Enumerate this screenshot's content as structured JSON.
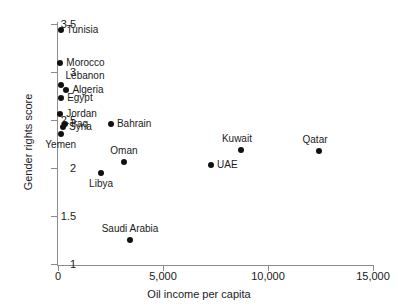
{
  "chart_data": {
    "type": "scatter",
    "title": "",
    "xlabel": "Oil income per capita",
    "ylabel": "Gender rights score",
    "xlim": [
      0,
      15000
    ],
    "ylim": [
      1,
      3.5
    ],
    "grid": false,
    "legend": "none",
    "xticks": [
      "0",
      "5,000",
      "10,000",
      "15,000"
    ],
    "xtick_values": [
      0,
      5000,
      10000,
      15000
    ],
    "yticks": [
      "1",
      "1.5",
      "2",
      "2.5",
      "3",
      "3.5"
    ],
    "ytick_values": [
      1,
      1.5,
      2,
      2.5,
      3,
      3.5
    ],
    "points": [
      {
        "label": "Tunisia",
        "x": 120,
        "y": 3.44,
        "label_pos": "right"
      },
      {
        "label": "Morocco",
        "x": 110,
        "y": 3.09,
        "label_pos": "right"
      },
      {
        "label": "Lebanon",
        "x": 120,
        "y": 2.86,
        "label_pos": "above-right"
      },
      {
        "label": "Algeria",
        "x": 400,
        "y": 2.81,
        "label_pos": "right"
      },
      {
        "label": "Egypt",
        "x": 150,
        "y": 2.73,
        "label_pos": "right"
      },
      {
        "label": "Jordan",
        "x": 110,
        "y": 2.56,
        "label_pos": "right"
      },
      {
        "label": "Iraq",
        "x": 330,
        "y": 2.46,
        "label_pos": "right"
      },
      {
        "label": "Syria",
        "x": 240,
        "y": 2.43,
        "label_pos": "right"
      },
      {
        "label": "Yemen",
        "x": 130,
        "y": 2.35,
        "label_pos": "below"
      },
      {
        "label": "Bahrain",
        "x": 2520,
        "y": 2.46,
        "label_pos": "right"
      },
      {
        "label": "Oman",
        "x": 3140,
        "y": 2.06,
        "label_pos": "above"
      },
      {
        "label": "Libya",
        "x": 2050,
        "y": 1.95,
        "label_pos": "below"
      },
      {
        "label": "Saudi Arabia",
        "x": 3430,
        "y": 1.25,
        "label_pos": "above"
      },
      {
        "label": "UAE",
        "x": 7290,
        "y": 2.03,
        "label_pos": "right"
      },
      {
        "label": "Kuwait",
        "x": 8710,
        "y": 2.19,
        "label_pos": "above-left"
      },
      {
        "label": "Qatar",
        "x": 12430,
        "y": 2.18,
        "label_pos": "above-left"
      }
    ]
  }
}
